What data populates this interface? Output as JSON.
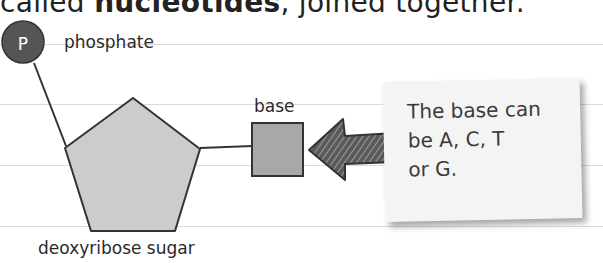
{
  "heading": {
    "prefix": "called ",
    "bold": "nucleotides",
    "suffix": ", joined together."
  },
  "diagram": {
    "phosphate_symbol": "P",
    "phosphate_label": "phosphate",
    "sugar_label": "deoxyribose sugar",
    "base_label": "base",
    "note_text": "The base can\nbe A, C, T\nor G.",
    "colors": {
      "phosphate_fill": "#555555",
      "sugar_fill": "#cccccc",
      "base_fill": "#a8a8a8",
      "arrow_fill": "#4a4a4a",
      "note_bg": "#f4f4f4",
      "rule_line": "#dcdcdc"
    }
  }
}
